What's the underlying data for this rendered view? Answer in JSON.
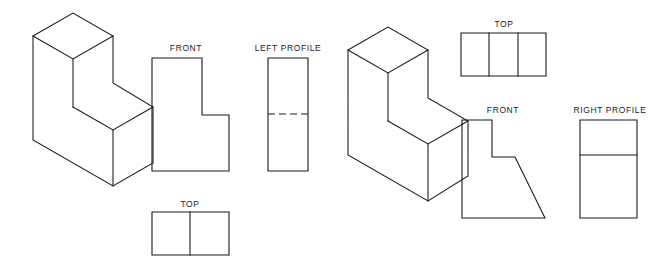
{
  "sheet": {
    "background_color": "#ffffff",
    "line_color": "#1a1a1a",
    "width": 662,
    "height": 271
  },
  "figures": [
    {
      "id": "figure-1",
      "name": "l-block",
      "pictorial": {
        "name": "isometric-l-block",
        "style": "isometric",
        "faces": {
          "top_upper": "33,36 73,13 113,36 73,59",
          "top_step": "73,107 113,84 153,107 113,130",
          "left_front": "33,36 33,140 113,186 113,83",
          "right_upper": "113,36 113,83 73,107 73,59",
          "right_lower": "153,107 153,163 113,186 113,130"
        },
        "edges": [
          "33,36 73,13 113,36 113,83 153,107 153,163 113,186 33,140 33,36",
          "33,36 73,59 113,36",
          "73,59 73,107",
          "73,107 113,130 153,107",
          "113,130 113,186"
        ]
      },
      "views": [
        {
          "name": "front-view",
          "label": "FRONT",
          "label_x": 186,
          "label_y": 51,
          "shape": "L-shape",
          "outline": "152,58 202,58 202,115 229,115 229,171 152,171 152,58",
          "dividers": [],
          "hidden_lines": []
        },
        {
          "name": "left-profile-view",
          "label": "LEFT PROFILE",
          "label_x": 288,
          "label_y": 51,
          "shape": "rectangle",
          "outline": "268,58 308,58 308,171 268,171 268,58",
          "dividers": [],
          "hidden_lines": [
            "268,114 308,114"
          ]
        },
        {
          "name": "top-view",
          "label": "TOP",
          "label_x": 190,
          "label_y": 207,
          "shape": "rectangle-split-vertical",
          "outline": "152,212 229,212 229,255 152,255 152,212",
          "dividers": [
            "190,212 190,255"
          ],
          "hidden_lines": []
        }
      ]
    },
    {
      "id": "figure-2",
      "name": "inclined-face-block",
      "pictorial": {
        "name": "isometric-inclined-block",
        "style": "isometric",
        "faces": {
          "top_upper": "348,50 388,27 428,50 388,73",
          "top_step": "388,121 428,98 468,121 428,144",
          "left_front": "348,50 348,155 428,201 428,98",
          "right_upper": "428,50 428,98 388,73 388,121",
          "inclined": "428,144 468,121 468,176 428,201"
        },
        "edges": [
          "348,50 388,27 428,50 428,98 468,121 468,176 428,201 348,155 348,50",
          "348,50 388,73 428,50",
          "388,73 388,121",
          "388,121 428,144 468,121",
          "428,144 428,201"
        ]
      },
      "views": [
        {
          "name": "top-view",
          "label": "TOP",
          "label_x": 504,
          "label_y": 27,
          "shape": "rectangle-split-vertical-x2",
          "outline": "461,33 546,33 546,76 461,76 461,33",
          "dividers": [
            "489,33 489,76",
            "518,33 518,76"
          ],
          "hidden_lines": []
        },
        {
          "name": "front-view",
          "label": "FRONT",
          "label_x": 503,
          "label_y": 113,
          "shape": "L-shape-with-incline",
          "outline": "462,120 492,120 492,157 515,157 545,218 462,218 462,120",
          "dividers": [],
          "hidden_lines": []
        },
        {
          "name": "right-profile-view",
          "label": "RIGHT PROFILE",
          "label_x": 610,
          "label_y": 113,
          "shape": "rectangle-split-horizontal",
          "outline": "580,120 637,120 637,218 580,218 580,120",
          "dividers": [
            "580,155 637,155"
          ],
          "hidden_lines": []
        }
      ]
    }
  ]
}
